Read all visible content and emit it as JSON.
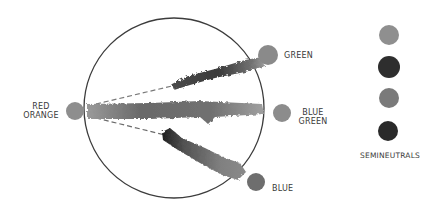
{
  "diagram": {
    "type": "color-mixing-paths",
    "source": {
      "label_line1": "RED",
      "label_line2": "ORANGE",
      "color": "#8e8e8e"
    },
    "targets": [
      {
        "id": "green",
        "label_line1": "GREEN",
        "label_line2": "",
        "color": "#8a8a8a"
      },
      {
        "id": "blue-green",
        "label_line1": "BLUE",
        "label_line2": "GREEN",
        "color": "#8c8c8c"
      },
      {
        "id": "blue",
        "label_line1": "BLUE",
        "label_line2": "",
        "color": "#6e6e6e"
      }
    ],
    "semineutrals": {
      "label": "SEMINEUTRALS",
      "swatches": [
        {
          "color": "#8f8f8f"
        },
        {
          "color": "#2e2e2e"
        },
        {
          "color": "#7a7a7a"
        },
        {
          "color": "#2a2a2a"
        }
      ]
    },
    "colors": {
      "circle_stroke": "#3c3c3c",
      "dash": "#7a7a7a",
      "label_text": "#3a3a3a"
    }
  }
}
